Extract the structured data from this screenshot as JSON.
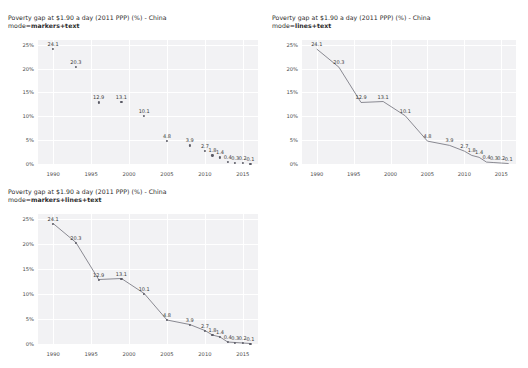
{
  "page": {
    "background_color": "#ffffff",
    "plot_background_color": "#f2f2f4",
    "marker_color": "#5b5b66",
    "line_color": "#6e6e78",
    "grid_color": "#ffffff"
  },
  "panels": [
    {
      "id": "panel-markers-text",
      "title": "Poverty gap at $1.90 a day (2011 PPP) (%) - China",
      "mode_label": "mode=",
      "mode_value": "markers+text",
      "show_markers": true,
      "show_lines": false
    },
    {
      "id": "panel-lines-text",
      "title": "Poverty gap at $1.90 a day (2011 PPP) (%) - China",
      "mode_label": "mode=",
      "mode_value": "lines+text",
      "show_markers": false,
      "show_lines": true
    },
    {
      "id": "panel-markers-lines-text",
      "title": "Poverty gap at $1.90 a day (2011 PPP) (%) - China",
      "mode_label": "mode=",
      "mode_value": "markers+lines+text",
      "show_markers": true,
      "show_lines": true
    }
  ],
  "chart_data": {
    "type": "scatter",
    "title": "Poverty gap at $1.90 a day (2011 PPP) (%) - China",
    "xlabel": "",
    "ylabel": "",
    "grid": true,
    "legend": "none",
    "xlim": [
      1988,
      2017
    ],
    "ylim": [
      0,
      26
    ],
    "xticks": [
      1990,
      1995,
      2000,
      2005,
      2010,
      2015
    ],
    "xticklabels": [
      "1990",
      "1995",
      "2000",
      "2005",
      "2010",
      "2015"
    ],
    "yticks": [
      0,
      5,
      10,
      15,
      20,
      25
    ],
    "yticklabels": [
      "0%",
      "5%",
      "10%",
      "15%",
      "20%",
      "25%"
    ],
    "x": [
      1990,
      1993,
      1996,
      1999,
      2002,
      2005,
      2008,
      2010,
      2011,
      2012,
      2013,
      2014,
      2015,
      2016
    ],
    "y": [
      24.1,
      20.3,
      12.9,
      13.1,
      10.1,
      4.8,
      3.9,
      2.7,
      1.8,
      1.4,
      0.4,
      0.3,
      0.2,
      0.1
    ],
    "text": [
      "24.1",
      "20.3",
      "12.9",
      "13.1",
      "10.1",
      "4.8",
      "3.9",
      "2.7",
      "1.8",
      "1.4",
      "0.4",
      "0.3",
      "0.2",
      "0.1"
    ]
  }
}
